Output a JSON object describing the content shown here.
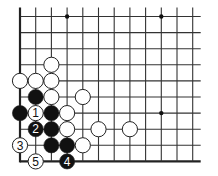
{
  "diagram": {
    "type": "go-board-fragment",
    "grid": {
      "columns": 12,
      "rows": 10,
      "origin_x": 20,
      "origin_y": 16.5,
      "spacing_x": 15.7,
      "spacing_y": 16.1,
      "extend_right": 8,
      "extend_top": 9,
      "edges": [
        "left",
        "bottom"
      ],
      "line_color": "#333333",
      "edge_color": "#222222"
    },
    "star_points": [
      {
        "col": 3,
        "row": 0
      },
      {
        "col": 9,
        "row": 0
      },
      {
        "col": 9,
        "row": 6
      }
    ],
    "stones": [
      {
        "color": "white",
        "col": 2,
        "row": 3,
        "label": ""
      },
      {
        "color": "white",
        "col": 0,
        "row": 4,
        "label": ""
      },
      {
        "color": "white",
        "col": 1,
        "row": 4,
        "label": ""
      },
      {
        "color": "white",
        "col": 2,
        "row": 4,
        "label": ""
      },
      {
        "color": "black",
        "col": 1,
        "row": 5,
        "label": ""
      },
      {
        "color": "white",
        "col": 2,
        "row": 5,
        "label": ""
      },
      {
        "color": "white",
        "col": 4,
        "row": 5,
        "label": ""
      },
      {
        "color": "black",
        "col": 0,
        "row": 6,
        "label": ""
      },
      {
        "color": "white",
        "col": 1,
        "row": 6,
        "label": "1"
      },
      {
        "color": "black",
        "col": 2,
        "row": 6,
        "label": ""
      },
      {
        "color": "white",
        "col": 3,
        "row": 6,
        "label": ""
      },
      {
        "color": "black",
        "col": 1,
        "row": 7,
        "label": "2"
      },
      {
        "color": "black",
        "col": 2,
        "row": 7,
        "label": ""
      },
      {
        "color": "white",
        "col": 3,
        "row": 7,
        "label": ""
      },
      {
        "color": "white",
        "col": 5,
        "row": 7,
        "label": ""
      },
      {
        "color": "white",
        "col": 7,
        "row": 7,
        "label": ""
      },
      {
        "color": "white",
        "col": 0,
        "row": 8,
        "label": "3"
      },
      {
        "color": "black",
        "col": 2,
        "row": 8,
        "label": ""
      },
      {
        "color": "black",
        "col": 3,
        "row": 8,
        "label": ""
      },
      {
        "color": "white",
        "col": 4,
        "row": 8,
        "label": ""
      },
      {
        "color": "white",
        "col": 1,
        "row": 9,
        "label": "5"
      },
      {
        "color": "black",
        "col": 3,
        "row": 9,
        "label": "4"
      }
    ],
    "colors": {
      "black_stone": "#111111",
      "white_stone": "#ffffff",
      "stone_outline": "#222222",
      "black_label": "#ffffff",
      "white_label": "#111111"
    }
  }
}
